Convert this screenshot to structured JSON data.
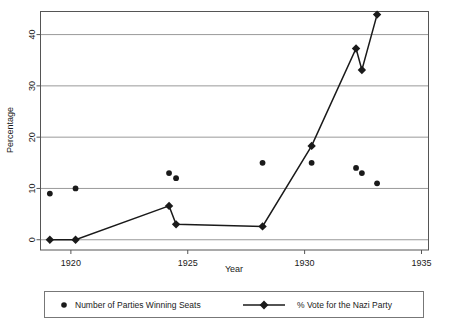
{
  "chart_data": {
    "type": "scatter",
    "title": "",
    "xlabel": "Year",
    "ylabel": "Percentage",
    "xlim": [
      1918.7,
      1935.3
    ],
    "ylim": [
      -2,
      44.5
    ],
    "xticks": [
      1920,
      1925,
      1930,
      1935
    ],
    "xtick_labels": [
      "1920",
      "1925",
      "1930",
      "1935"
    ],
    "yticks": [
      0,
      10,
      20,
      30,
      40
    ],
    "ytick_labels": [
      "0",
      "10",
      "20",
      "30",
      "40"
    ],
    "grid": "horizontal",
    "legend_position": "bottom",
    "series": [
      {
        "name": "Number of Parties Winning Seats",
        "marker": "circle",
        "line": false,
        "points": [
          {
            "x": 1919.1,
            "y": 9
          },
          {
            "x": 1920.2,
            "y": 10
          },
          {
            "x": 1924.2,
            "y": 13
          },
          {
            "x": 1924.5,
            "y": 12
          },
          {
            "x": 1928.2,
            "y": 15
          },
          {
            "x": 1930.3,
            "y": 15
          },
          {
            "x": 1932.2,
            "y": 14
          },
          {
            "x": 1932.45,
            "y": 13
          },
          {
            "x": 1933.1,
            "y": 11
          }
        ]
      },
      {
        "name": "% Vote for the Nazi Party",
        "marker": "diamond",
        "line": true,
        "points": [
          {
            "x": 1919.1,
            "y": 0
          },
          {
            "x": 1920.2,
            "y": 0
          },
          {
            "x": 1924.2,
            "y": 6.6
          },
          {
            "x": 1924.5,
            "y": 3.0
          },
          {
            "x": 1928.2,
            "y": 2.6
          },
          {
            "x": 1930.3,
            "y": 18.3
          },
          {
            "x": 1932.2,
            "y": 37.3
          },
          {
            "x": 1932.45,
            "y": 33.1
          },
          {
            "x": 1933.1,
            "y": 43.9
          }
        ]
      }
    ]
  },
  "legend": {
    "entries": [
      {
        "label": "Number of Parties Winning Seats",
        "marker": "circle-marker"
      },
      {
        "label": "% Vote for the Nazi Party",
        "marker": "line-diamond-marker"
      }
    ]
  },
  "colors": {
    "series_color": "#1a1a1a",
    "grid_color": "#999999",
    "frame_color": "#555555",
    "background": "#ffffff"
  }
}
